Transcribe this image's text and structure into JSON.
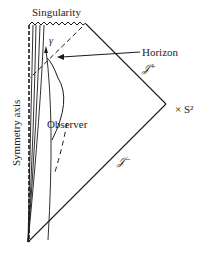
{
  "diagram": {
    "labels": {
      "singularity": "Singularity",
      "horizon": "Horizon",
      "scri_plus": "𝒥⁺",
      "scri_minus": "𝒥⁻",
      "sphere": "× S²",
      "symmetry_axis": "Symmetry axis",
      "observer": "Observer",
      "gamma": "γ"
    },
    "colors": {
      "line": "#1a1a1a",
      "background": "#ffffff"
    }
  }
}
